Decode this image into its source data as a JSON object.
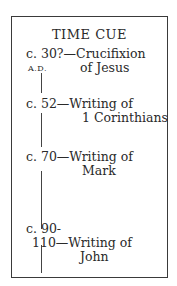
{
  "title": "TIME CUE",
  "era_label": "A.D.",
  "entries": [
    {
      "date": "c. 30?",
      "line1": "Crucifixion",
      "line2": "of Jesus"
    },
    {
      "date": "c. 52",
      "line1": "Writing of",
      "line2": "1 Corinthians"
    },
    {
      "date": "c. 70",
      "line1": "Writing of",
      "line2": "Mark"
    },
    {
      "date_line1": "c. 90-",
      "date_line2": "110",
      "line1": "Writing of",
      "line2": "John"
    }
  ],
  "dash": "—"
}
